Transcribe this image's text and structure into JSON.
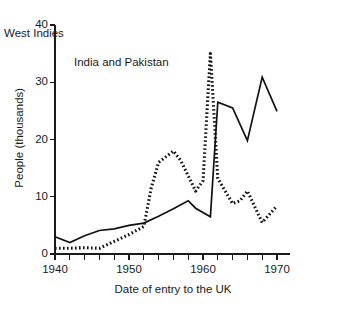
{
  "chart_data": {
    "type": "line",
    "title": "",
    "xlabel": "Date of entry to the UK",
    "ylabel": "People (thousands)",
    "xlim": [
      1940,
      1970
    ],
    "ylim": [
      0,
      40
    ],
    "grid": false,
    "legend_position": "inline-annotations",
    "x_ticks": [
      1940,
      1942,
      1944,
      1946,
      1948,
      1950,
      1952,
      1954,
      1956,
      1958,
      1960,
      1962,
      1964,
      1966,
      1968,
      1970
    ],
    "x_tick_labels": [
      "1940",
      "",
      "",
      "",
      "",
      "1950",
      "",
      "",
      "",
      "",
      "1960",
      "",
      "",
      "",
      "",
      "1970"
    ],
    "y_ticks": [
      0,
      10,
      20,
      30,
      40
    ],
    "y_tick_labels": [
      "0",
      "10",
      "20",
      "30",
      "40"
    ],
    "series": [
      {
        "name": "West Indies",
        "style": "dotted",
        "color": "#111111",
        "label_x": 1956.5,
        "label_y": 38.5,
        "x": [
          1940,
          1942,
          1944,
          1946,
          1948,
          1950,
          1952,
          1953,
          1954,
          1956,
          1957,
          1959,
          1960,
          1961,
          1962,
          1963,
          1964,
          1965,
          1966,
          1968,
          1970
        ],
        "y": [
          1.0,
          1.0,
          1.1,
          1.0,
          2.2,
          3.4,
          4.8,
          11.5,
          16.0,
          18.0,
          16.3,
          11.0,
          12.8,
          35.0,
          13.2,
          11.0,
          8.8,
          9.3,
          11.0,
          5.5,
          8.4
        ]
      },
      {
        "name": "India and Pakistan",
        "style": "solid",
        "color": "#111111",
        "label_x": 1966.0,
        "label_y": 33.3,
        "x": [
          1940,
          1942,
          1944,
          1946,
          1948,
          1950,
          1952,
          1954,
          1956,
          1958,
          1959,
          1961,
          1962,
          1964,
          1966,
          1968,
          1970
        ],
        "y": [
          3.0,
          2.0,
          3.2,
          4.1,
          4.4,
          5.0,
          5.4,
          6.6,
          7.9,
          9.3,
          8.0,
          6.5,
          26.5,
          25.5,
          19.8,
          30.9,
          24.9
        ]
      }
    ]
  },
  "annotations": {
    "west_indies_label": "West Indies",
    "india_pakistan_label": "India and Pakistan"
  }
}
